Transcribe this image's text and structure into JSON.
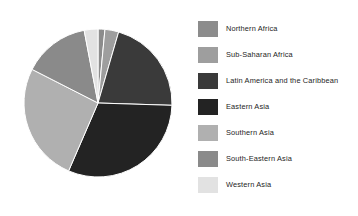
{
  "chart_data": {
    "type": "pie",
    "title": "",
    "subtitle": "",
    "xlabel": "",
    "ylabel": "",
    "grid": false,
    "legend_position": "right",
    "start_angle_deg": 0,
    "direction": "clockwise",
    "categories": [
      "Northern Africa",
      "Sub-Saharan Africa",
      "Latin America and the Caribbean",
      "Eastern Asia",
      "Southern Asia",
      "South-Eastern Asia",
      "Western Asia"
    ],
    "values": [
      1.5,
      3.0,
      21.0,
      31.0,
      26.0,
      14.5,
      3.0
    ],
    "colors": [
      "#8c8c8c",
      "#9e9e9e",
      "#3a3a3a",
      "#232323",
      "#b0b0b0",
      "#8a8a8a",
      "#e2e2e2"
    ],
    "slices": [
      {
        "label": "Northern Africa",
        "value": 1.5,
        "color": "#8c8c8c"
      },
      {
        "label": "Sub-Saharan Africa",
        "value": 3.0,
        "color": "#9e9e9e"
      },
      {
        "label": "Latin America and the Caribbean",
        "value": 21.0,
        "color": "#3a3a3a"
      },
      {
        "label": "Eastern Asia",
        "value": 31.0,
        "color": "#232323"
      },
      {
        "label": "Southern Asia",
        "value": 26.0,
        "color": "#b0b0b0"
      },
      {
        "label": "South-Eastern Asia",
        "value": 14.5,
        "color": "#8a8a8a"
      },
      {
        "label": "Western Asia",
        "value": 3.0,
        "color": "#e2e2e2"
      }
    ]
  },
  "legend": {
    "items": [
      {
        "label": "Northern Africa",
        "color": "#8c8c8c"
      },
      {
        "label": "Sub-Saharan Africa",
        "color": "#9e9e9e"
      },
      {
        "label": "Latin America and the Caribbean",
        "color": "#3a3a3a"
      },
      {
        "label": "Eastern Asia",
        "color": "#232323"
      },
      {
        "label": "Southern Asia",
        "color": "#b0b0b0"
      },
      {
        "label": "South-Eastern Asia",
        "color": "#8a8a8a"
      },
      {
        "label": "Western Asia",
        "color": "#e2e2e2"
      }
    ]
  },
  "figure": {
    "background": "#ffffff",
    "pie_center_x": 98,
    "pie_center_y": 103,
    "pie_radius": 74
  }
}
